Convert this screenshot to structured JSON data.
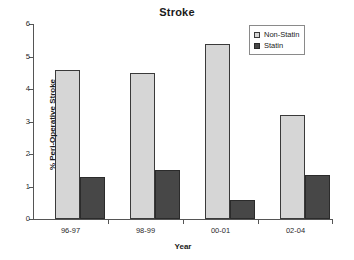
{
  "chart_data": {
    "type": "bar",
    "title": "Stroke",
    "xlabel": "Year",
    "ylabel": "% Peri-Operative Stroke",
    "categories": [
      "96-97",
      "98-99",
      "00-01",
      "02-04"
    ],
    "series": [
      {
        "name": "Non-Statin",
        "color": "#d6d6d6",
        "values": [
          4.6,
          4.5,
          5.4,
          3.2
        ]
      },
      {
        "name": "Statin",
        "color": "#474747",
        "values": [
          1.3,
          1.5,
          0.6,
          1.35
        ]
      }
    ],
    "ylim": [
      0,
      6
    ],
    "yticks": [
      "0",
      "1",
      "2",
      "3",
      "4",
      "5",
      "6"
    ],
    "grid": false,
    "legend_position": "top-right"
  }
}
